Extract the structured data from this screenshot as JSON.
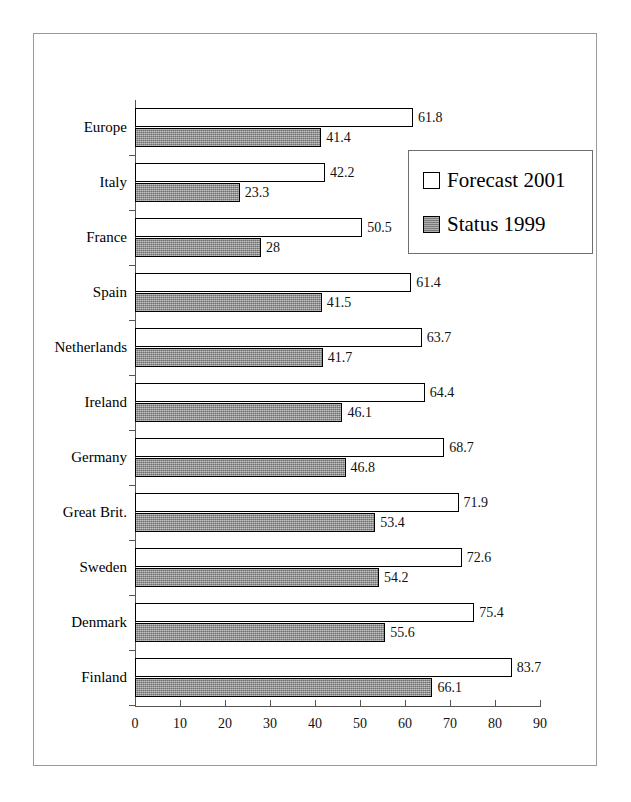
{
  "chart_data": {
    "type": "bar",
    "orientation": "horizontal",
    "title": "",
    "subtitle": "",
    "xlabel": "",
    "ylabel": "",
    "xlim": [
      0,
      90
    ],
    "ylim": null,
    "grid": false,
    "legend_position": "upper-right-inside",
    "categories": [
      "Europe",
      "Italy",
      "France",
      "Spain",
      "Netherlands",
      "Ireland",
      "Germany",
      "Great Brit.",
      "Sweden",
      "Denmark",
      "Finland"
    ],
    "series": [
      {
        "name": "Forecast 2001",
        "style": "white-fill-black-outline",
        "values": [
          61.8,
          42.2,
          50.5,
          61.4,
          63.7,
          64.4,
          68.7,
          71.9,
          72.6,
          75.4,
          83.7
        ],
        "labels": [
          "61.8",
          "42.2",
          "50.5",
          "61.4",
          "63.7",
          "64.4",
          "68.7",
          "71.9",
          "72.6",
          "75.4",
          "83.7"
        ]
      },
      {
        "name": "Status 1999",
        "style": "gray-fill-black-outline",
        "values": [
          41.4,
          23.3,
          28,
          41.5,
          41.7,
          46.1,
          46.8,
          53.4,
          54.2,
          55.6,
          66.1
        ],
        "labels": [
          "41.4",
          "23.3",
          "28",
          "41.5",
          "41.7",
          "46.1",
          "46.8",
          "53.4",
          "54.2",
          "55.6",
          "66.1"
        ]
      }
    ],
    "xticks": [
      0,
      10,
      20,
      30,
      40,
      50,
      60,
      70,
      80,
      90
    ],
    "xtick_labels": [
      "0",
      "10",
      "20",
      "30",
      "40",
      "50",
      "60",
      "70",
      "80",
      "90"
    ]
  },
  "legend": {
    "items": [
      {
        "label": "Forecast 2001",
        "swatch": "white-square"
      },
      {
        "label": "Status 1999",
        "swatch": "gray-square"
      }
    ]
  },
  "colors": {
    "forecast_fill": "#ffffff",
    "status_fill": "#8c8c8c",
    "bar_outline": "#000000",
    "axis": "#555555",
    "frame": "#9a9a9a",
    "text": "#000000",
    "background": "#ffffff"
  }
}
